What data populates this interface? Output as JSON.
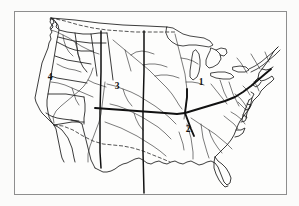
{
  "figure": {
    "title": "",
    "kind": "outline-map",
    "background_color": "#fbfbfa",
    "frame_color": "#8e8e8e",
    "ink_color": "#1a1a1a"
  },
  "map": {
    "subject": "Contiguous United States",
    "frame": {
      "x": 14,
      "y": 11,
      "width": 273,
      "height": 184
    },
    "features": [
      "pacific-coastline",
      "atlantic-coastline",
      "gulf-coastline",
      "florida-peninsula",
      "great-lakes",
      "canadian-border-dashed",
      "mexican-border-dashed",
      "river-network",
      "mississippi-ohio-main-stem",
      "region-divider-lines"
    ],
    "region_labels": [
      {
        "id": "1",
        "text": "1",
        "x": 200,
        "y": 84,
        "region": "northeast-great-lakes"
      },
      {
        "id": "2",
        "text": "2",
        "x": 187,
        "y": 131,
        "region": "southeast"
      },
      {
        "id": "3",
        "text": "3",
        "x": 116,
        "y": 88,
        "region": "central-plains"
      },
      {
        "id": "4",
        "text": "4",
        "x": 49,
        "y": 79,
        "region": "west"
      }
    ],
    "dividers": [
      {
        "id": "divider-west",
        "orientation": "vertical",
        "x": 100
      },
      {
        "id": "divider-central",
        "orientation": "vertical",
        "x": 143
      },
      {
        "id": "divider-main-river",
        "orientation": "horizontal-curved"
      }
    ],
    "legend": {
      "visible": false,
      "entries": []
    },
    "caption": ""
  }
}
